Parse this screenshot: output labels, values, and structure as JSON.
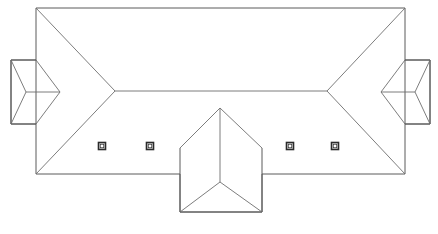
{
  "drawing": {
    "type": "architectural-roof-plan",
    "title": "Roof Plan",
    "canvas": {
      "width": 438,
      "height": 234
    },
    "colors": {
      "background": "#ffffff",
      "outline": "#5a5a5a",
      "hip_line": "#6e6e6e",
      "ridge_line": "#6e6e6e",
      "vent_stroke": "#2a2a2a",
      "vent_fill": "#ffffff"
    },
    "main_body": {
      "name": "main-roof",
      "outline_points": "36,8 405,8 405,60 430,60 430,124 405,124 405,174 262,174 262,212 180,212 180,174 36,174 36,124 11,124 11,60 36,60 36,8",
      "ridge": {
        "x1": 115,
        "y1": 91,
        "x2": 327,
        "y2": 91
      },
      "hips": [
        {
          "x1": 36,
          "y1": 8,
          "x2": 115,
          "y2": 91
        },
        {
          "x1": 36,
          "y1": 174,
          "x2": 115,
          "y2": 91
        },
        {
          "x1": 405,
          "y1": 8,
          "x2": 327,
          "y2": 91
        },
        {
          "x1": 405,
          "y1": 174,
          "x2": 327,
          "y2": 91
        }
      ]
    },
    "left_wing": {
      "name": "left-wing-roof",
      "outline_points": "11,60 36,60 36,124 11,124 11,60",
      "ridge": {
        "x1": 26,
        "y1": 92,
        "x2": 60,
        "y2": 92
      },
      "hips": [
        {
          "x1": 11,
          "y1": 60,
          "x2": 26,
          "y2": 92
        },
        {
          "x1": 11,
          "y1": 124,
          "x2": 26,
          "y2": 92
        },
        {
          "x1": 36,
          "y1": 60,
          "x2": 60,
          "y2": 92
        },
        {
          "x1": 36,
          "y1": 124,
          "x2": 60,
          "y2": 92
        }
      ]
    },
    "right_wing": {
      "name": "right-wing-roof",
      "outline_points": "430,60 405,60 405,124 430,124 430,60",
      "ridge": {
        "x1": 415,
        "y1": 92,
        "x2": 381,
        "y2": 92
      },
      "hips": [
        {
          "x1": 430,
          "y1": 60,
          "x2": 415,
          "y2": 92
        },
        {
          "x1": 430,
          "y1": 124,
          "x2": 415,
          "y2": 92
        },
        {
          "x1": 405,
          "y1": 60,
          "x2": 381,
          "y2": 92
        },
        {
          "x1": 405,
          "y1": 124,
          "x2": 381,
          "y2": 92
        }
      ]
    },
    "front_projection": {
      "name": "front-gable-projection",
      "outline_points": "180,148 180,212 262,212 262,148",
      "apex": {
        "x": 220,
        "y": 108
      },
      "ridge": {
        "x1": 220,
        "y1": 108,
        "x2": 220,
        "y2": 182
      },
      "hips": [
        {
          "x1": 180,
          "y1": 148,
          "x2": 220,
          "y2": 108
        },
        {
          "x1": 262,
          "y1": 148,
          "x2": 220,
          "y2": 108
        },
        {
          "x1": 180,
          "y1": 212,
          "x2": 220,
          "y2": 182
        },
        {
          "x1": 262,
          "y1": 212,
          "x2": 220,
          "y2": 182
        }
      ]
    },
    "vents": [
      {
        "label": "roof-vent-1",
        "x": 102,
        "y": 146,
        "size": 7
      },
      {
        "label": "roof-vent-2",
        "x": 150,
        "y": 146,
        "size": 7
      },
      {
        "label": "roof-vent-3",
        "x": 290,
        "y": 146,
        "size": 7
      },
      {
        "label": "roof-vent-4",
        "x": 335,
        "y": 146,
        "size": 7
      }
    ]
  }
}
